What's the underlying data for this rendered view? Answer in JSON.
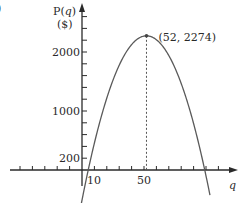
{
  "panel_label": ")",
  "chart_data": {
    "type": "line",
    "title": "",
    "xlabel": "q",
    "ylabel": "P(q)",
    "ylabel_unit": "($)",
    "x_ticks_labeled": [
      10,
      50
    ],
    "y_ticks_labeled": [
      200,
      1000,
      2000
    ],
    "xlim": [
      -28,
      110
    ],
    "ylim": [
      -350,
      2700
    ],
    "x_tick_step": 10,
    "y_tick_step": 200,
    "grid": false,
    "series": [
      {
        "name": "P(q)",
        "function": "2274 - 1.03*(q-52)^2",
        "vertex": [
          52,
          2274
        ],
        "x": [
          0,
          5,
          10,
          20,
          30,
          40,
          50,
          52,
          60,
          70,
          80,
          90,
          99,
          103
        ],
        "values": [
          -511,
          0,
          457,
          1219,
          1776,
          2126,
          2270,
          2274,
          2208,
          1940,
          1466,
          787,
          0,
          -405
        ]
      }
    ],
    "annotations": [
      {
        "text": "(52, 2274)",
        "x": 52,
        "y": 2274,
        "dashed_drop_line": true
      }
    ],
    "colors": {
      "axis": "#2a2a2a",
      "curve": "#555555"
    }
  }
}
